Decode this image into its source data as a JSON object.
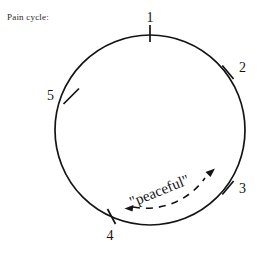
{
  "caption": {
    "text": "Pain cycle:"
  },
  "diagram": {
    "type": "cycle-circle",
    "geometry": {
      "center_x": 150,
      "center_y": 130,
      "radius": 95
    },
    "nodes": [
      {
        "label": "1",
        "angle_deg": 0,
        "label_x": 150,
        "label_y": 22,
        "anchor": "middle"
      },
      {
        "label": "2",
        "angle_deg": 55,
        "label_x": 239,
        "label_y": 72,
        "anchor": "start"
      },
      {
        "label": "3",
        "angle_deg": 125,
        "label_x": 239,
        "label_y": 193,
        "anchor": "start"
      },
      {
        "label": "4",
        "angle_deg": 203,
        "label_x": 110,
        "label_y": 240,
        "anchor": "middle"
      },
      {
        "label": "5",
        "angle_deg": 303,
        "label_x": 54,
        "label_y": 100,
        "anchor": "end"
      }
    ],
    "arc_annotation": {
      "label": "\"peaceful\"",
      "style": "dashed",
      "arrow_start": true,
      "arrow_end": true,
      "from_node": "4",
      "to_node": "3"
    },
    "colors": {
      "stroke": "#141414",
      "background": "#ffffff",
      "caption": "#2b2b2b"
    }
  }
}
